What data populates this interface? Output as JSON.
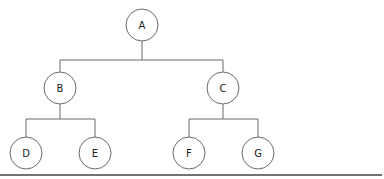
{
  "diagram": {
    "type": "binary-tree",
    "nodes": [
      {
        "id": "A",
        "label": "A",
        "x": 142,
        "y": 25,
        "r": 16
      },
      {
        "id": "B",
        "label": "B",
        "x": 60,
        "y": 88,
        "r": 16
      },
      {
        "id": "C",
        "label": "C",
        "x": 223,
        "y": 88,
        "r": 16
      },
      {
        "id": "D",
        "label": "D",
        "x": 26,
        "y": 153,
        "r": 16
      },
      {
        "id": "E",
        "label": "E",
        "x": 95,
        "y": 153,
        "r": 16
      },
      {
        "id": "F",
        "label": "F",
        "x": 189,
        "y": 153,
        "r": 16
      },
      {
        "id": "G",
        "label": "G",
        "x": 258,
        "y": 153,
        "r": 16
      }
    ],
    "edges": [
      {
        "from": "A",
        "to": "B"
      },
      {
        "from": "A",
        "to": "C"
      },
      {
        "from": "B",
        "to": "D"
      },
      {
        "from": "B",
        "to": "E"
      },
      {
        "from": "C",
        "to": "F"
      },
      {
        "from": "C",
        "to": "G"
      }
    ],
    "colors": {
      "stroke": "#6a6a6a",
      "text": "#222222",
      "baseline": "#444444"
    }
  }
}
